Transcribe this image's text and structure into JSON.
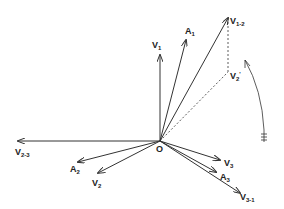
{
  "diagram": {
    "type": "phasor-vector-diagram",
    "origin": {
      "label": "O",
      "x": 160,
      "y": 141
    },
    "line_color": "#333333",
    "vectors": [
      {
        "id": "V1",
        "base": "V",
        "sub": "1",
        "x": 160,
        "y": 55,
        "lx": 152,
        "ly": 48
      },
      {
        "id": "A1",
        "base": "A",
        "sub": "1",
        "x": 186,
        "y": 40,
        "lx": 185,
        "ly": 34
      },
      {
        "id": "V1-2",
        "base": "V",
        "sub": "1-2",
        "x": 228,
        "y": 18,
        "lx": 230,
        "ly": 24
      },
      {
        "id": "V2-3",
        "base": "V",
        "sub": "2-3",
        "x": 18,
        "y": 141,
        "lx": 15,
        "ly": 155
      },
      {
        "id": "A2",
        "base": "A",
        "sub": "2",
        "x": 78,
        "y": 162,
        "lx": 70,
        "ly": 172
      },
      {
        "id": "V2",
        "base": "V",
        "sub": "2",
        "x": 98,
        "y": 173,
        "lx": 92,
        "ly": 186
      },
      {
        "id": "V3",
        "base": "V",
        "sub": "3",
        "x": 220,
        "y": 160,
        "lx": 224,
        "ly": 166
      },
      {
        "id": "A3",
        "base": "A",
        "sub": "3",
        "x": 216,
        "y": 172,
        "lx": 220,
        "ly": 180
      },
      {
        "id": "V3-1",
        "base": "V",
        "sub": "3-1",
        "x": 240,
        "y": 193,
        "lx": 240,
        "ly": 200
      }
    ],
    "dashed": [
      {
        "id": "V2prime",
        "base": "V",
        "sub": "2",
        "prime": "'",
        "x": 228,
        "y": 72,
        "lx": 230,
        "ly": 79
      }
    ],
    "rotation_arrow": {
      "label": "direction of rotation (counter-clockwise)"
    }
  }
}
